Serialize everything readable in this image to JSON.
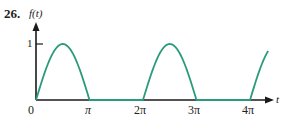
{
  "problem_number": "26.",
  "colors": {
    "curve": "#2a9a7c",
    "axis": "#1a1a1a"
  },
  "chart_data": {
    "type": "line",
    "title": "",
    "xlabel": "t",
    "ylabel": "f(t)",
    "x_ticks": [
      "0",
      "π",
      "2π",
      "3π",
      "4π"
    ],
    "y_ticks": [
      "1"
    ],
    "series": [
      {
        "name": "f(t)",
        "x": [
          "0",
          "π/2",
          "π",
          "2π",
          "5π/2",
          "3π",
          "4π",
          "4.34π"
        ],
        "y": [
          0,
          1,
          0,
          0,
          1,
          0,
          0,
          0.88
        ]
      }
    ],
    "xlim": [
      "0",
      "~4.35π"
    ],
    "ylim": [
      0,
      1
    ],
    "grid": false
  }
}
